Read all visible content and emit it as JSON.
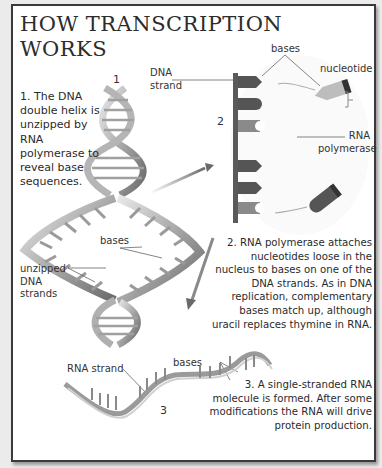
{
  "title": "HOW TRANSCRIPTION WORKS",
  "title_lines": [
    "HOW TRANSCRIPTION",
    "WORKS"
  ],
  "steps": [
    {
      "number": "1",
      "text": "1. The DNA double helix is unzipped by RNA polymerase to reveal base sequences."
    },
    {
      "number": "2",
      "text": "2. RNA polymerase attaches nucleotides loose in the nucleus to bases on one of the DNA strands. As in DNA replication, complementary bases match up, although uracil replaces thymine in RNA."
    },
    {
      "number": "3",
      "text": "3. A single-stranded RNA molecule is formed. After some modifications the RNA will drive protein production."
    }
  ],
  "labels": {
    "dna_strand": "DNA strand",
    "bases_top": "bases",
    "nucleotide": "nucleotide",
    "rna_polymerase": "RNA polymerase",
    "bases_middle": "bases",
    "unzipped": "unzipped DNA strands",
    "rna_strand": "RNA strand",
    "bases_bottom": "bases"
  },
  "colors": {
    "frame_border": "#3a3a3a",
    "strand_dark": "#5a5a5a",
    "base_dark": "#555555",
    "base_light": "#8a8a8a",
    "nucleotide_light": "#b8b8b8",
    "helix_light": "#c8c8c8"
  }
}
